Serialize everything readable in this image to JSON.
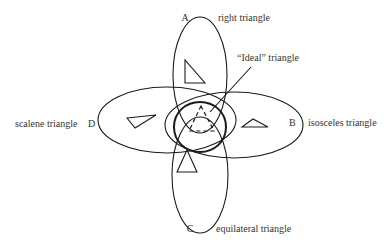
{
  "diagram": {
    "sets": [
      {
        "letter": "A",
        "label": "right triangle"
      },
      {
        "letter": "B",
        "label": "isosceles triangle"
      },
      {
        "letter": "C",
        "label": "equilateral triangle"
      },
      {
        "letter": "D",
        "label": "scalene triangle"
      }
    ],
    "ideal_label": "“Ideal” triangle",
    "colors": {
      "stroke": "#1a1a1a",
      "text": "#333333",
      "background": "#ffffff"
    }
  }
}
